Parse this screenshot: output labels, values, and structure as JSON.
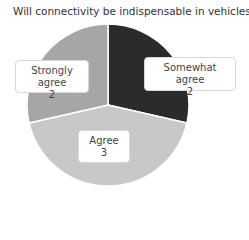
{
  "chart_data": {
    "type": "pie",
    "title": "Will connectivity be indispensable in vehicles?",
    "categories": [
      "Somewhat agree",
      "Agree",
      "Strongly agree"
    ],
    "values": [
      2,
      3,
      2
    ],
    "colors": [
      "#2b2b2b",
      "#c8c8c8",
      "#a6a6a6"
    ],
    "start_angle_deg": 0,
    "direction": "clockwise",
    "legend": "none",
    "data_labels": [
      "Somewhat agree\n2",
      "Agree\n3",
      "Strongly agree\n2"
    ]
  },
  "labels": [
    {
      "name": "Somewhat agree",
      "value": "2"
    },
    {
      "name": "Agree",
      "value": "3"
    },
    {
      "name": "Strongly agree",
      "value": "2"
    }
  ]
}
